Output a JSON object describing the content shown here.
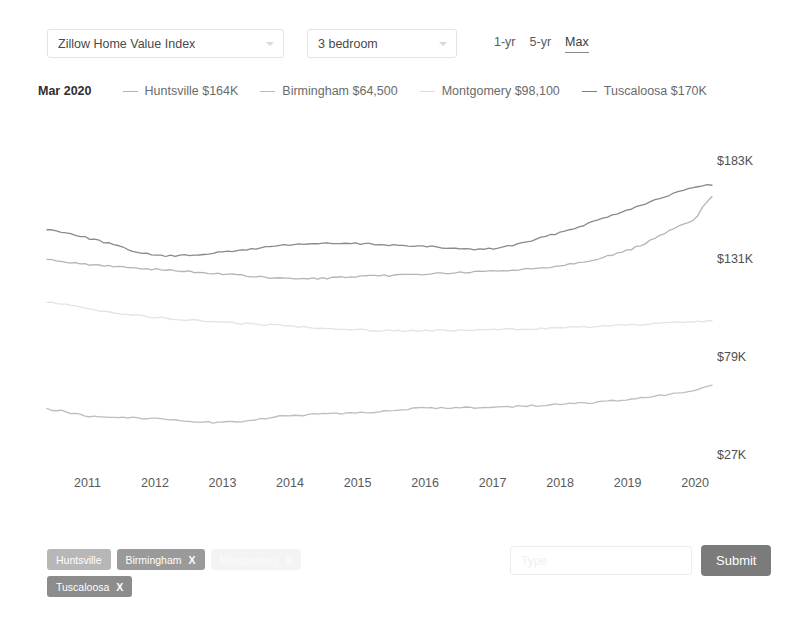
{
  "controls": {
    "metric_select": {
      "value": "Zillow Home Value Index",
      "icon": "chevron-down-icon"
    },
    "bedroom_select": {
      "value": "3 bedroom",
      "icon": "chevron-down-icon"
    },
    "ranges": [
      {
        "label": "1-yr",
        "active": false
      },
      {
        "label": "5-yr",
        "active": false
      },
      {
        "label": "Max",
        "active": true
      }
    ]
  },
  "legend": {
    "date": "Mar 2020",
    "items": [
      {
        "label": "Huntsville $164K",
        "color": "#b4b4b4"
      },
      {
        "label": "Birmingham $64,500",
        "color": "#b9b9b9"
      },
      {
        "label": "Montgomery $98,100",
        "color": "#dcdcdc"
      },
      {
        "label": "Tuscaloosa $170K",
        "color": "#7e7e7e"
      }
    ]
  },
  "chips": [
    {
      "label": "Huntsville",
      "close": "",
      "bg": "#b7b7b7"
    },
    {
      "label": "Birmingham",
      "close": "X",
      "bg": "#9a9a9a"
    },
    {
      "label": "Montgomery",
      "close": "X",
      "bg": "#f4f4f4"
    },
    {
      "label": "Tuscaloosa",
      "close": "X",
      "bg": "#8c8c8c"
    }
  ],
  "form": {
    "input_placeholder": "Type",
    "input_value": "",
    "submit_label": "Submit"
  },
  "chart_data": {
    "type": "line",
    "title": "",
    "xlabel": "",
    "ylabel": "",
    "grid": false,
    "legend_position": "top",
    "ytick_labels": [
      "$183K",
      "$131K",
      "$79K",
      "$27K"
    ],
    "ytick_values": [
      183000,
      131000,
      79000,
      27000
    ],
    "ylim": [
      14000,
      196000
    ],
    "xtick_labels": [
      "2011",
      "2012",
      "2013",
      "2014",
      "2015",
      "2016",
      "2017",
      "2018",
      "2019",
      "2020"
    ],
    "x": [
      2010.4,
      2011,
      2012,
      2013,
      2014,
      2015,
      2016,
      2017,
      2018,
      2019,
      2020,
      2020.25
    ],
    "series": [
      {
        "name": "Tuscaloosa",
        "color": "#8a8a8a",
        "end_value": 170000,
        "values": [
          146500,
          142000,
          133000,
          134500,
          138500,
          139000,
          137500,
          136500,
          145000,
          157000,
          168500,
          170000
        ]
      },
      {
        "name": "Huntsville",
        "color": "#b5b5b5",
        "end_value": 164000,
        "values": [
          130500,
          128000,
          125500,
          123000,
          120500,
          121500,
          123000,
          124500,
          127500,
          135500,
          152000,
          164000
        ]
      },
      {
        "name": "Montgomery",
        "color": "#e3e3e3",
        "end_value": 98100,
        "values": [
          108000,
          104500,
          100000,
          97500,
          95500,
          93500,
          93000,
          93500,
          94500,
          96000,
          97500,
          98100
        ]
      },
      {
        "name": "Birmingham",
        "color": "#bdbdbd",
        "end_value": 64500,
        "values": [
          51500,
          48000,
          46500,
          44500,
          48000,
          49500,
          52000,
          52500,
          54000,
          56500,
          61000,
          64500
        ]
      }
    ]
  }
}
